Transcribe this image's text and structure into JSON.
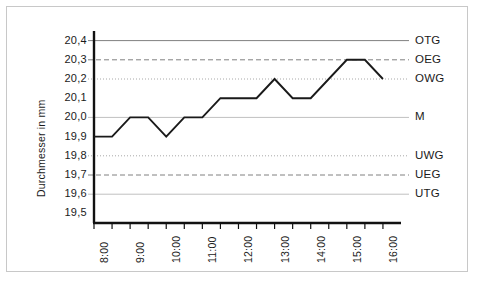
{
  "chart_data": {
    "type": "line",
    "title": "",
    "xlabel": "",
    "ylabel": "Durchmesser  in mm",
    "ylim": [
      19.45,
      20.45
    ],
    "xlim": [
      8.0,
      16.5
    ],
    "grid": true,
    "legend_position": "right",
    "x_tick_labels": [
      "8:00",
      "9:00",
      "10:00",
      "11:00",
      "12:00",
      "13:00",
      "14:00",
      "15:00",
      "16:00"
    ],
    "x_tick_values": [
      8,
      9,
      10,
      11,
      12,
      13,
      14,
      15,
      16
    ],
    "x_minor_tick_values": [
      8.5,
      9.5,
      10.5,
      11.5,
      12.5,
      13.5,
      14.5,
      15.5
    ],
    "y_tick_labels": [
      "20,4",
      "20,3",
      "20,2",
      "20,1",
      "20,0",
      "19,9",
      "19,8",
      "19,7",
      "19,6",
      "19,5"
    ],
    "y_tick_values": [
      20.4,
      20.3,
      20.2,
      20.1,
      20.0,
      19.9,
      19.8,
      19.7,
      19.6,
      19.5
    ],
    "series": [
      {
        "name": "Durchmesser",
        "color": "#1a1a1a",
        "x": [
          8.0,
          8.5,
          9.0,
          9.5,
          10.0,
          10.5,
          11.0,
          11.5,
          12.0,
          12.5,
          13.0,
          13.5,
          14.0,
          14.5,
          15.0,
          15.5,
          16.0
        ],
        "values": [
          19.9,
          19.9,
          20.0,
          20.0,
          19.9,
          20.0,
          20.0,
          20.1,
          20.1,
          20.1,
          20.2,
          20.1,
          20.1,
          20.2,
          20.3,
          20.3,
          20.2
        ]
      }
    ],
    "reference_lines": [
      {
        "label": "OTG",
        "value": 20.4,
        "style": "solid",
        "color": "#808080"
      },
      {
        "label": "OEG",
        "value": 20.3,
        "style": "dashed",
        "color": "#808080"
      },
      {
        "label": "OWG",
        "value": 20.2,
        "style": "dotted",
        "color": "#a8a8a8"
      },
      {
        "label": "M",
        "value": 20.0,
        "style": "solid",
        "color": "#c0c0c0"
      },
      {
        "label": "UWG",
        "value": 19.8,
        "style": "dotted",
        "color": "#a8a8a8"
      },
      {
        "label": "UEG",
        "value": 19.7,
        "style": "dashed",
        "color": "#808080"
      },
      {
        "label": "UTG",
        "value": 19.6,
        "style": "solid",
        "color": "#c0c0c0"
      }
    ]
  }
}
